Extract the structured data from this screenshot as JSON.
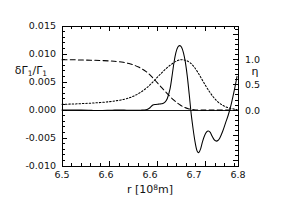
{
  "figure": {
    "background": "#ffffff",
    "frame_color": "#000000"
  },
  "chart_data": {
    "type": "line",
    "title": "",
    "xlabel": "r  [10⁸m]",
    "ylabel_left": "δΓ₁/Γ₁",
    "ylabel_right": "η",
    "xlim": [
      6.5,
      6.868
    ],
    "ylim_left": [
      -0.01,
      0.015
    ],
    "ylim_right": [
      -1.11,
      1.67
    ],
    "grid": false,
    "legend": "none",
    "x_ticks": [
      6.5,
      6.6,
      6.7,
      6.8
    ],
    "x_tick_labels": [
      "6.5",
      "6.6",
      "6.6",
      "6.7",
      "6.8"
    ],
    "x_tick_label_positions": [
      6.5,
      6.592,
      6.684,
      6.776,
      6.868
    ],
    "y_ticks_left": [
      -0.01,
      -0.005,
      0.0,
      0.005,
      0.01,
      0.015
    ],
    "y_tick_labels_left": [
      "-0.010",
      "-0.005",
      "0.000",
      "0.005",
      "0.010",
      "0.015"
    ],
    "y_ticks_right": [
      0.0,
      0.5,
      1.0
    ],
    "y_tick_labels_right": [
      "0.0",
      "0.5",
      "1.0"
    ],
    "minor_ticks_per_major_x": 5,
    "minor_ticks_per_major_y": 5,
    "zero_line": 0.0,
    "series": [
      {
        "name": "delta-Gamma-over-Gamma",
        "style": "solid",
        "axis": "left",
        "color": "#000000",
        "x": [
          6.5,
          6.52,
          6.54,
          6.555,
          6.565,
          6.575,
          6.585,
          6.595,
          6.605,
          6.615,
          6.625,
          6.635,
          6.645,
          6.655,
          6.665,
          6.672,
          6.678,
          6.684,
          6.69,
          6.696,
          6.702,
          6.708,
          6.714,
          6.72,
          6.726,
          6.73,
          6.734,
          6.738,
          6.742,
          6.746,
          6.75,
          6.754,
          6.758,
          6.762,
          6.766,
          6.77,
          6.774,
          6.778,
          6.782,
          6.786,
          6.79,
          6.794,
          6.798,
          6.802,
          6.806,
          6.81,
          6.814,
          6.818,
          6.822,
          6.826,
          6.83,
          6.836,
          6.842,
          6.848,
          6.854,
          6.86,
          6.866
        ],
        "y": [
          0.0,
          0.0,
          -2e-05,
          -5e-05,
          -8e-05,
          -0.0001,
          -8e-05,
          -5e-05,
          -3e-05,
          -2e-05,
          -2e-05,
          -3e-05,
          -5e-05,
          -5e-05,
          -3e-05,
          0.0,
          0.0001,
          0.0004,
          0.0009,
          0.001,
          0.00105,
          0.0011,
          0.0013,
          0.002,
          0.0038,
          0.006,
          0.0084,
          0.0102,
          0.0112,
          0.0115,
          0.0112,
          0.0102,
          0.0085,
          0.006,
          0.0028,
          -0.0006,
          -0.0033,
          -0.0056,
          -0.0072,
          -0.0076,
          -0.0069,
          -0.0056,
          -0.0046,
          -0.00395,
          -0.00375,
          -0.004,
          -0.0047,
          -0.0053,
          -0.00555,
          -0.00545,
          -0.005,
          -0.0038,
          -0.0023,
          -0.0008,
          0.0011,
          0.0034,
          0.006
        ]
      },
      {
        "name": "eta-dashed",
        "style": "dashed",
        "axis": "right",
        "color": "#000000",
        "x": [
          6.5,
          6.52,
          6.54,
          6.56,
          6.58,
          6.6,
          6.615,
          6.628,
          6.64,
          6.65,
          6.66,
          6.668,
          6.676,
          6.684,
          6.692,
          6.7,
          6.708,
          6.716,
          6.724,
          6.732,
          6.74,
          6.748,
          6.756,
          6.764,
          6.772,
          6.78,
          6.79,
          6.8,
          6.82,
          6.85,
          6.866
        ],
        "y": [
          1.0,
          1.0,
          0.995,
          0.99,
          0.985,
          0.975,
          0.965,
          0.95,
          0.925,
          0.895,
          0.855,
          0.815,
          0.765,
          0.7,
          0.62,
          0.535,
          0.45,
          0.37,
          0.29,
          0.215,
          0.15,
          0.095,
          0.055,
          0.028,
          0.012,
          0.004,
          0.0,
          0.0,
          0.0,
          0.0,
          0.0
        ]
      },
      {
        "name": "eta-dotted",
        "style": "dotted",
        "axis": "right",
        "color": "#000000",
        "x": [
          6.5,
          6.52,
          6.54,
          6.56,
          6.58,
          6.6,
          6.615,
          6.63,
          6.642,
          6.652,
          6.662,
          6.67,
          6.678,
          6.686,
          6.694,
          6.702,
          6.71,
          6.718,
          6.726,
          6.734,
          6.742,
          6.748,
          6.754,
          6.76,
          6.768,
          6.776,
          6.784,
          6.792,
          6.8,
          6.808,
          6.816,
          6.824,
          6.832,
          6.84,
          6.85,
          6.86,
          6.866
        ],
        "y": [
          0.115,
          0.12,
          0.128,
          0.138,
          0.15,
          0.168,
          0.188,
          0.215,
          0.248,
          0.288,
          0.34,
          0.39,
          0.45,
          0.52,
          0.598,
          0.678,
          0.755,
          0.828,
          0.89,
          0.945,
          0.985,
          1.0,
          0.998,
          0.985,
          0.94,
          0.86,
          0.75,
          0.62,
          0.49,
          0.37,
          0.265,
          0.18,
          0.12,
          0.075,
          0.04,
          0.02,
          0.012
        ]
      }
    ]
  }
}
